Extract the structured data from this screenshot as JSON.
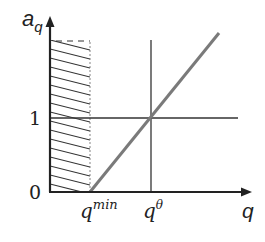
{
  "diagram": {
    "y_axis_label": "a",
    "y_axis_subscript": "q",
    "x_axis_label": "q",
    "y_ticks": [
      {
        "label": "1",
        "value": 1
      },
      {
        "label": "0",
        "value": 0
      }
    ],
    "x_ticks": [
      {
        "label": "q",
        "superscript": "min"
      },
      {
        "label": "q",
        "superscript": "θ"
      }
    ],
    "elements": {
      "hatched_region": "infeasible region between 0 and q^min",
      "horizontal_line": "a_q = 1",
      "vertical_line": "q = q^θ",
      "diagonal_line": "linear rise from (q^min, 0) through (q^θ, 1)"
    },
    "colors": {
      "axis": "#222222",
      "diagonal": "#777777",
      "hatch": "#333333"
    }
  }
}
